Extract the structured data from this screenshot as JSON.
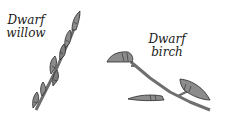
{
  "labels": {
    "willow": [
      "Dwarf",
      "willow"
    ],
    "birch": [
      "Dwarf",
      "birch"
    ]
  },
  "illustrations": [
    {
      "name": "dwarf-willow-twig",
      "description": "slender twig with elongated buds pressed along stem"
    },
    {
      "name": "dwarf-birch-twig",
      "description": "forked twig with three pointed buds"
    }
  ],
  "colors": {
    "bud_fill": "#8c8c8c",
    "bud_shadow": "#5a5a5a",
    "stem": "#7a7a7a",
    "outline": "#2a2a2a",
    "text": "#1a1a1a"
  }
}
